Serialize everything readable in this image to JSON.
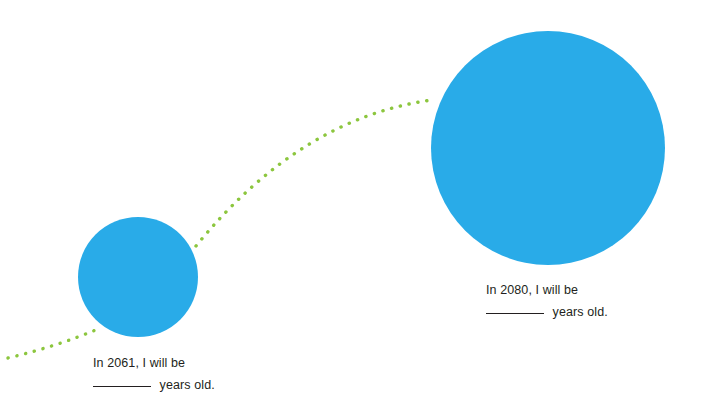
{
  "page": {
    "background_color": "#ffffff"
  },
  "palette": {
    "circle_blue": "#29abe8",
    "dotted_green": "#8cc63e",
    "text_color": "#231f20"
  },
  "illustration": {
    "circles": [
      {
        "name": "small-circle",
        "label_year": "2061",
        "cx": 138,
        "cy": 277,
        "r": 60,
        "color": "#29abe8"
      },
      {
        "name": "large-circle",
        "label_year": "2080",
        "cx": 548,
        "cy": 148,
        "r": 117,
        "color": "#29abe8"
      }
    ],
    "dotted_path": {
      "name": "dotted-connector-curve",
      "color": "#8cc63e",
      "dot_radius": 1.7,
      "dot_spacing": 9,
      "segments": [
        {
          "from": [
            8,
            358
          ],
          "control": [
            58,
            346
          ],
          "to": [
            98,
            329
          ]
        },
        {
          "from": [
            196,
            246
          ],
          "control": [
            300,
            118
          ],
          "to": [
            432,
            100
          ]
        }
      ]
    }
  },
  "captions": [
    {
      "id": "caption-2061",
      "line1": "In 2061, I will be",
      "blank": "________",
      "line2_suffix": " years old.",
      "year": "2061"
    },
    {
      "id": "caption-2080",
      "line1": "In 2080, I will be",
      "blank": "________",
      "line2_suffix": " years old.",
      "year": "2080"
    }
  ]
}
